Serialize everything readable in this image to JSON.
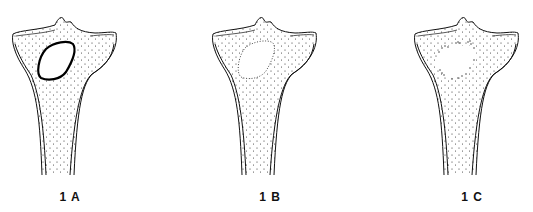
{
  "figures": [
    {
      "label": "1 A",
      "lesion": "solid-outline",
      "offset_x": 0
    },
    {
      "label": "1 B",
      "lesion": "dotted-outline",
      "offset_x": 200
    },
    {
      "label": "1 C",
      "lesion": "irregular-stippled",
      "offset_x": 402
    }
  ],
  "colors": {
    "line": "#111111",
    "background": "#ffffff"
  }
}
